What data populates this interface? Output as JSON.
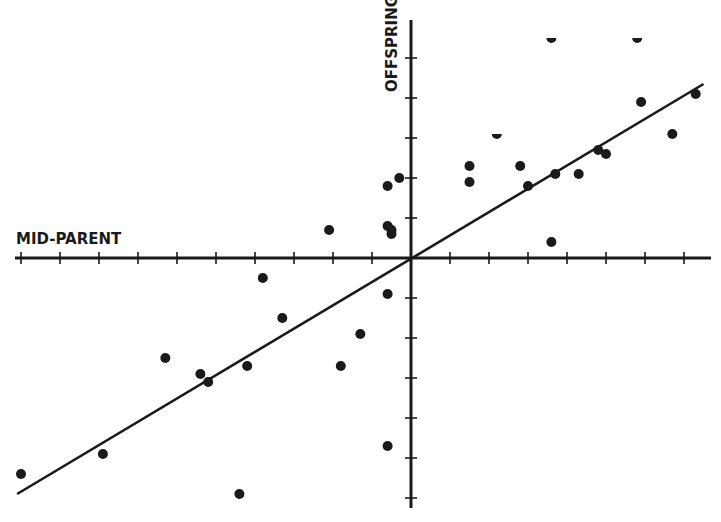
{
  "chart_data": {
    "type": "scatter",
    "title": "",
    "xlabel": "MID-PARENT",
    "ylabel": "OFFSPRING",
    "grid": false,
    "legend": null,
    "xlim": [
      -10.2,
      7.4
    ],
    "ylim": [
      -6.0,
      5.9
    ],
    "x_tick_step": 1,
    "y_tick_step": 1,
    "tick_labels_shown": false,
    "colors": {
      "ink": "#1a1a1a",
      "background": "#ffffff"
    },
    "points": [
      {
        "x": -10.0,
        "y": -5.4
      },
      {
        "x": -7.9,
        "y": -4.9
      },
      {
        "x": -6.3,
        "y": -2.5
      },
      {
        "x": -5.4,
        "y": -2.9
      },
      {
        "x": -5.2,
        "y": -3.1
      },
      {
        "x": -4.2,
        "y": -2.7
      },
      {
        "x": -4.4,
        "y": -5.9
      },
      {
        "x": -3.8,
        "y": -0.5
      },
      {
        "x": -3.3,
        "y": -1.5
      },
      {
        "x": -2.1,
        "y": 0.7
      },
      {
        "x": -1.8,
        "y": -2.7
      },
      {
        "x": -1.3,
        "y": -1.9
      },
      {
        "x": -0.6,
        "y": 1.8
      },
      {
        "x": -0.6,
        "y": 0.8
      },
      {
        "x": -0.5,
        "y": 0.7
      },
      {
        "x": -0.5,
        "y": 0.6
      },
      {
        "x": -0.3,
        "y": 2.0
      },
      {
        "x": -0.6,
        "y": -0.9
      },
      {
        "x": -0.6,
        "y": -4.7
      },
      {
        "x": 1.5,
        "y": 2.3
      },
      {
        "x": 1.5,
        "y": 1.9
      },
      {
        "x": 2.2,
        "y": 3.1,
        "clipped": true
      },
      {
        "x": 2.8,
        "y": 2.3
      },
      {
        "x": 3.0,
        "y": 1.8
      },
      {
        "x": 3.6,
        "y": 5.5,
        "clipped": true
      },
      {
        "x": 3.7,
        "y": 2.1
      },
      {
        "x": 3.6,
        "y": 0.4
      },
      {
        "x": 4.3,
        "y": 2.1
      },
      {
        "x": 4.8,
        "y": 2.7
      },
      {
        "x": 5.0,
        "y": 2.6
      },
      {
        "x": 5.8,
        "y": 5.5,
        "clipped": true
      },
      {
        "x": 5.9,
        "y": 3.9
      },
      {
        "x": 6.7,
        "y": 3.1
      },
      {
        "x": 7.3,
        "y": 4.1
      }
    ],
    "regression_line": {
      "from": {
        "x": -10.1,
        "y": -5.9
      },
      "to": {
        "x": 7.5,
        "y": 4.35
      },
      "slope": 0.58,
      "intercept": 0.0
    }
  },
  "labels": {
    "x_axis": "MID-PARENT",
    "y_axis": "OFFSPRING"
  },
  "layout": {
    "origin_px": [
      411,
      258
    ],
    "x_px_per_unit": 39,
    "y_px_per_unit": 40,
    "x_axis_px": [
      15,
      711
    ],
    "y_axis_px": [
      20,
      508
    ]
  }
}
